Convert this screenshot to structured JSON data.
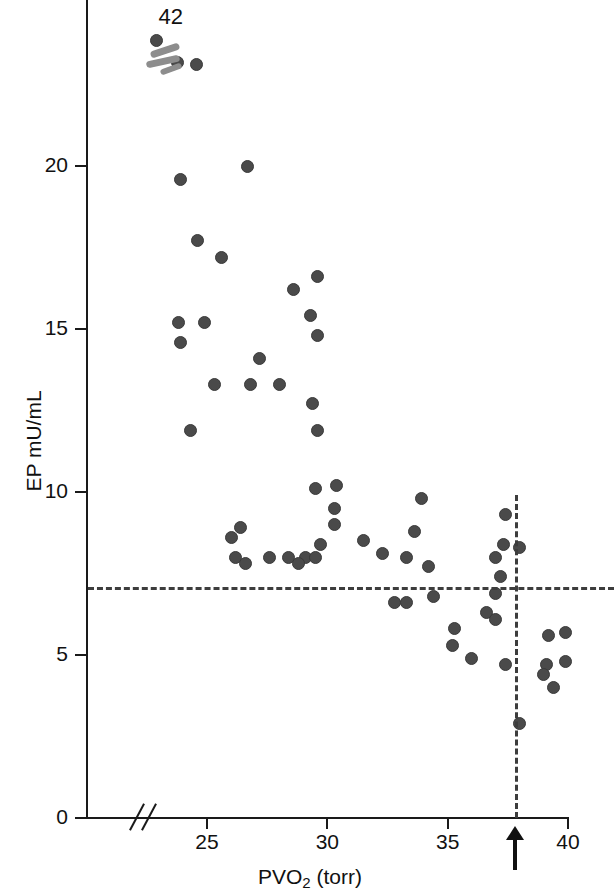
{
  "figure": {
    "kind": "scatter-plot",
    "background": "#ffffff",
    "marker_color": "#4a4a4a",
    "reference_line_color": "#3d3d3d",
    "axis_color": "#1a1a1a"
  },
  "annotations": {
    "offscale_label": "42",
    "offscale_note": "cluster of off-scale points plotted above the axis top, labelled 42",
    "threshold_arrow_name": "threshold-arrow-38"
  },
  "chart_data": {
    "type": "scatter",
    "title": "",
    "xlabel": "PVO2 (torr)",
    "xlabel_base": "PVO",
    "xlabel_sub": "2",
    "xlabel_unit": "(torr)",
    "ylabel": "EP mU/mL",
    "xlim": [
      21.6,
      40.5
    ],
    "ylim": [
      0,
      25
    ],
    "xticks": [
      25,
      30,
      35,
      40
    ],
    "xtick_labels": [
      "25",
      "30",
      "35",
      "40"
    ],
    "yticks": [
      0,
      5,
      10,
      15,
      20
    ],
    "ytick_labels": [
      "0",
      "5",
      "10",
      "15",
      "20"
    ],
    "grid": false,
    "legend": "none",
    "axis_break_x": true,
    "reference_lines": [
      {
        "name": "horizontal-threshold",
        "orientation": "horizontal",
        "value": 7.1,
        "style": "dashed",
        "axis": "y"
      },
      {
        "name": "vertical-threshold",
        "orientation": "vertical",
        "value": 37.8,
        "style": "dashed",
        "axis": "x"
      }
    ],
    "markers": [
      {
        "name": "arrow-marker",
        "axis": "x",
        "value": 37.8,
        "label": ""
      }
    ],
    "offscale_points": [
      {
        "x": 22.9,
        "y": 23.6
      },
      {
        "x": 23.1,
        "y": 23.1
      },
      {
        "x": 23.4,
        "y": 23.2
      }
    ],
    "offscale_value_label": "42",
    "points": [
      {
        "x": 23.9,
        "y": 19.6
      },
      {
        "x": 26.7,
        "y": 20.0
      },
      {
        "x": 24.6,
        "y": 17.7
      },
      {
        "x": 25.6,
        "y": 17.2
      },
      {
        "x": 29.6,
        "y": 16.6
      },
      {
        "x": 28.6,
        "y": 16.2
      },
      {
        "x": 29.3,
        "y": 15.4
      },
      {
        "x": 23.8,
        "y": 15.2
      },
      {
        "x": 24.9,
        "y": 15.2
      },
      {
        "x": 29.6,
        "y": 14.8
      },
      {
        "x": 23.9,
        "y": 14.6
      },
      {
        "x": 27.2,
        "y": 14.1
      },
      {
        "x": 28.0,
        "y": 13.3
      },
      {
        "x": 25.3,
        "y": 13.3
      },
      {
        "x": 26.8,
        "y": 13.3
      },
      {
        "x": 29.4,
        "y": 12.7
      },
      {
        "x": 29.6,
        "y": 11.9
      },
      {
        "x": 24.3,
        "y": 11.9
      },
      {
        "x": 30.4,
        "y": 10.2
      },
      {
        "x": 29.5,
        "y": 10.1
      },
      {
        "x": 33.9,
        "y": 9.8
      },
      {
        "x": 30.3,
        "y": 9.5
      },
      {
        "x": 37.4,
        "y": 9.3
      },
      {
        "x": 26.4,
        "y": 8.9
      },
      {
        "x": 30.3,
        "y": 9.0
      },
      {
        "x": 33.6,
        "y": 8.8
      },
      {
        "x": 26.0,
        "y": 8.6
      },
      {
        "x": 31.5,
        "y": 8.5
      },
      {
        "x": 37.3,
        "y": 8.4
      },
      {
        "x": 38.0,
        "y": 8.3
      },
      {
        "x": 29.7,
        "y": 8.4
      },
      {
        "x": 32.3,
        "y": 8.1
      },
      {
        "x": 26.2,
        "y": 8.0
      },
      {
        "x": 27.6,
        "y": 8.0
      },
      {
        "x": 28.4,
        "y": 8.0
      },
      {
        "x": 29.1,
        "y": 8.0
      },
      {
        "x": 29.5,
        "y": 8.0
      },
      {
        "x": 33.3,
        "y": 8.0
      },
      {
        "x": 37.0,
        "y": 8.0
      },
      {
        "x": 26.6,
        "y": 7.8
      },
      {
        "x": 28.8,
        "y": 7.8
      },
      {
        "x": 34.2,
        "y": 7.7
      },
      {
        "x": 37.2,
        "y": 7.4
      },
      {
        "x": 32.8,
        "y": 6.6
      },
      {
        "x": 33.3,
        "y": 6.6
      },
      {
        "x": 34.4,
        "y": 6.8
      },
      {
        "x": 37.0,
        "y": 6.9
      },
      {
        "x": 36.6,
        "y": 6.3
      },
      {
        "x": 37.0,
        "y": 6.1
      },
      {
        "x": 35.3,
        "y": 5.8
      },
      {
        "x": 39.2,
        "y": 5.6
      },
      {
        "x": 39.9,
        "y": 5.7
      },
      {
        "x": 35.2,
        "y": 5.3
      },
      {
        "x": 36.0,
        "y": 4.9
      },
      {
        "x": 39.1,
        "y": 4.7
      },
      {
        "x": 39.9,
        "y": 4.8
      },
      {
        "x": 37.4,
        "y": 4.7
      },
      {
        "x": 39.0,
        "y": 4.4
      },
      {
        "x": 39.4,
        "y": 4.0
      },
      {
        "x": 38.0,
        "y": 2.9
      }
    ]
  }
}
